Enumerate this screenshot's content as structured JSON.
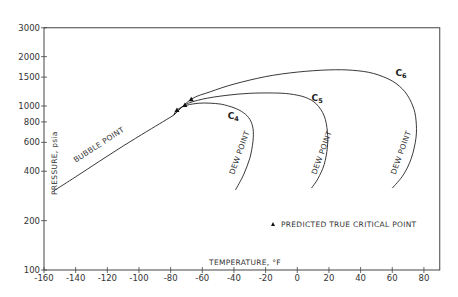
{
  "chart_data": {
    "type": "line",
    "title": "",
    "xlabel": "TEMPERATURE, °F",
    "ylabel": "PRESSURE, psia",
    "xlim": [
      -160,
      90
    ],
    "ylim": [
      100,
      3000
    ],
    "yscale": "log",
    "grid": false,
    "x_ticks": [
      -160,
      -140,
      -120,
      -100,
      -80,
      -60,
      -40,
      -20,
      0,
      20,
      40,
      60,
      80
    ],
    "x_tick_labels": [
      "-160",
      "-140",
      "-120",
      "-100",
      "-80",
      "-60",
      "-40",
      "-20",
      "0",
      "20",
      "40",
      "60",
      "80"
    ],
    "y_ticks": [
      100,
      200,
      400,
      600,
      800,
      1000,
      1500,
      2000,
      3000
    ],
    "y_tick_labels": [
      "100",
      "200",
      "400",
      "600",
      "800",
      "1000",
      "1500",
      "2000",
      "3000"
    ],
    "legend": {
      "marker": "▲",
      "label": "PREDICTED TRUE CRITICAL POINT",
      "position": "lower right"
    },
    "annotations": [
      {
        "text": "BUBBLE POINT",
        "x": -140,
        "y": 450
      },
      {
        "text": "DEW POINT",
        "x": -40,
        "y": 380,
        "curve": "C4"
      },
      {
        "text": "DEW POINT",
        "x": 12,
        "y": 380,
        "curve": "C5"
      },
      {
        "text": "DEW POINT",
        "x": 62,
        "y": 380,
        "curve": "C6"
      }
    ],
    "bubble_point": {
      "name": "BUBBLE POINT",
      "x": [
        -154,
        -140,
        -125,
        -110,
        -95,
        -85,
        -78
      ],
      "y": [
        303,
        370,
        460,
        570,
        700,
        800,
        880
      ]
    },
    "series": [
      {
        "name": "C4",
        "label_main": "C",
        "label_sub": "4",
        "label_pos": {
          "x": -44,
          "y": 830
        },
        "critical_point": {
          "x": -76,
          "y": 946
        },
        "x": [
          -78,
          -76,
          -70,
          -62,
          -55,
          -48,
          -40,
          -34,
          -30,
          -28,
          -28,
          -30,
          -34,
          -39
        ],
        "y": [
          880,
          946,
          1010,
          1040,
          1040,
          1025,
          975,
          910,
          830,
          730,
          610,
          480,
          380,
          308
        ]
      },
      {
        "name": "C5",
        "label_main": "C",
        "label_sub": "5",
        "label_pos": {
          "x": 9,
          "y": 1070
        },
        "critical_point": {
          "x": -71,
          "y": 1015
        },
        "x": [
          -78,
          -71,
          -60,
          -45,
          -30,
          -15,
          -5,
          5,
          12,
          17,
          19,
          19,
          17,
          13,
          9
        ],
        "y": [
          880,
          1015,
          1100,
          1160,
          1195,
          1200,
          1185,
          1130,
          1030,
          870,
          700,
          560,
          440,
          360,
          316
        ]
      },
      {
        "name": "C6",
        "label_main": "C",
        "label_sub": "6",
        "label_pos": {
          "x": 62,
          "y": 1520
        },
        "critical_point": {
          "x": -67,
          "y": 1100
        },
        "x": [
          -78,
          -67,
          -55,
          -40,
          -20,
          0,
          20,
          35,
          48,
          60,
          68,
          73,
          75,
          75,
          72,
          67,
          60
        ],
        "y": [
          880,
          1100,
          1220,
          1360,
          1510,
          1610,
          1660,
          1650,
          1580,
          1420,
          1220,
          1000,
          820,
          640,
          480,
          380,
          316
        ]
      }
    ]
  }
}
